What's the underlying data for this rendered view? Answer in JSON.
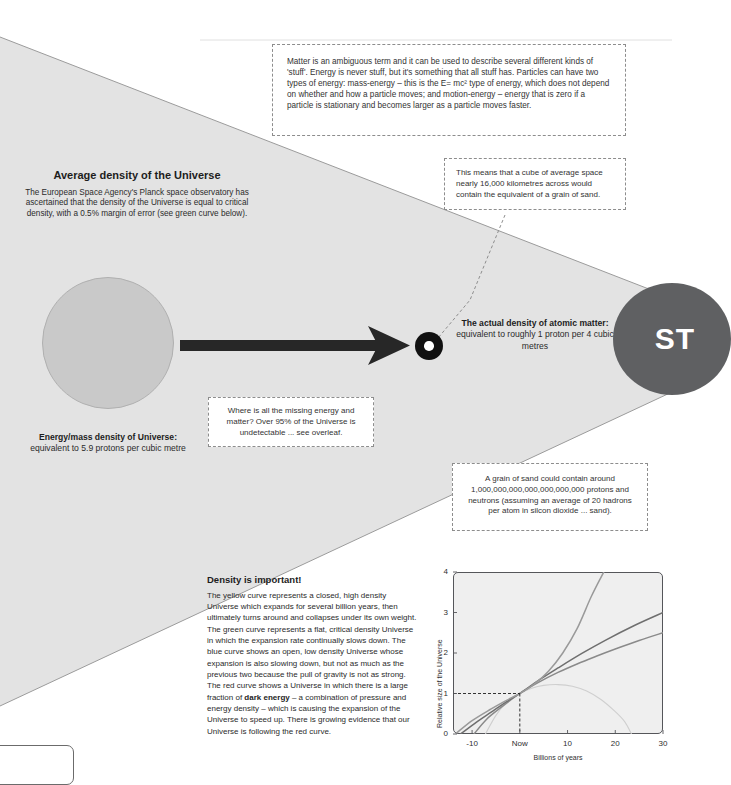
{
  "page": {
    "background_color": "#ffffff",
    "cone_fill": "#e2e2e2",
    "accent_dark": "#2b2b2b"
  },
  "callouts": {
    "matter_energy": "Matter is an ambiguous term and it can be used to describe several different kinds of 'stuff'. Energy is never stuff, but it's something that all stuff has. Particles can have two types of energy: mass-energy –  this is the E= mc² type of energy, which does not depend on whether and how a particle moves; and motion-energy – energy that is zero if a particle is stationary and becomes larger as a particle moves faster.",
    "cube_of_space": "This means that a cube of average space nearly 16,000 kilometres across would contain the equivalent of a grain of sand.",
    "missing_energy": "Where is all the missing energy and matter? Over 95% of the Universe is undetectable ...  see overleaf.",
    "grain_of_sand": "A grain of sand could contain around 1,000,000,000,000,000,000,000 protons and neutrons (assuming an average of 20 hadrons per atom in silcon dioxide ... sand)."
  },
  "average_density": {
    "heading": "Average density of the Universe",
    "body": "The European Space Agency's Planck space observatory has ascertained that the density of the Universe is equal to critical density, with a 0.5% margin of error (see green curve below)."
  },
  "energy_mass": {
    "bold": "Energy/mass density of Universe:",
    "rest": " equivalent to 5.9 protons per cubic metre"
  },
  "atomic_matter": {
    "bold": "The actual density of atomic matter:",
    "rest": " equivalent to roughly 1 proton per 4 cubic metres"
  },
  "st_circle": {
    "label": "ST"
  },
  "density_section": {
    "heading": "Density is important!",
    "part1": "The yellow curve represents a closed, high density Universe which expands for several billion years, then ultimately turns around and collapses under its own weight. The green curve represents a flat, critical density Universe in which the expansion rate continually slows down. The blue curve shows an open, low density Universe whose expansion is also slowing down, but not as much as the previous two because the pull of gravity is not as strong. The red curve shows a Universe in which there is a large fraction of ",
    "bold_term": "dark energy",
    "part2": " – a combination of pressure and energy density – which is causing the expansion of the Universe to speed up. There is growing evidence that our Universe is following the red curve."
  },
  "chart_data": {
    "type": "line",
    "title": "",
    "xlabel": "Billions of years",
    "ylabel": "Relative size of the Universe",
    "xlim": [
      -14,
      30
    ],
    "ylim": [
      0,
      4
    ],
    "xticks": [
      -10,
      0,
      10,
      20,
      30
    ],
    "xtick_labels": [
      "-10",
      "Now",
      "10",
      "20",
      "30"
    ],
    "yticks": [
      0,
      1,
      2,
      3,
      4
    ],
    "ytick_labels": [
      "0",
      "1",
      "2",
      "3",
      "4"
    ],
    "grid": false,
    "legend_position": "none",
    "reference_lines": {
      "style": "dashed",
      "x": 0,
      "y": 1,
      "note": "dashed guide from y-axis at 1 to the common crossing point at Now"
    },
    "series": [
      {
        "name": "closed, high density Universe (yellow curve)",
        "color": "#cfcfcf",
        "x": [
          -7.2,
          -5,
          -2.5,
          0,
          2.5,
          5,
          8,
          11,
          14,
          17,
          20,
          22,
          23.4
        ],
        "y": [
          0,
          0.46,
          0.82,
          1.0,
          1.13,
          1.2,
          1.22,
          1.18,
          1.06,
          0.85,
          0.55,
          0.3,
          0
        ]
      },
      {
        "name": "flat, critical density Universe (green curve)",
        "color": "#8a8a8a",
        "x": [
          -9.6,
          -7,
          -4,
          0,
          4,
          8,
          12,
          16,
          20,
          25,
          30
        ],
        "y": [
          0,
          0.36,
          0.65,
          1.0,
          1.28,
          1.52,
          1.73,
          1.92,
          2.1,
          2.31,
          2.5
        ]
      },
      {
        "name": "open, low density Universe (blue curve)",
        "color": "#6f6f6f",
        "x": [
          -12.4,
          -9,
          -6,
          -3,
          0,
          4,
          8,
          13,
          18,
          24,
          30
        ],
        "y": [
          0,
          0.3,
          0.54,
          0.78,
          1.0,
          1.33,
          1.63,
          1.99,
          2.32,
          2.68,
          3.0
        ]
      },
      {
        "name": "dark energy dominated Universe (red curve)",
        "color": "#9a9a9a",
        "x": [
          -13.5,
          -10,
          -6,
          -3,
          0,
          3,
          6,
          9,
          12,
          15,
          17.6
        ],
        "y": [
          0,
          0.33,
          0.62,
          0.82,
          1.0,
          1.23,
          1.55,
          2.0,
          2.6,
          3.4,
          4.0
        ]
      }
    ]
  }
}
